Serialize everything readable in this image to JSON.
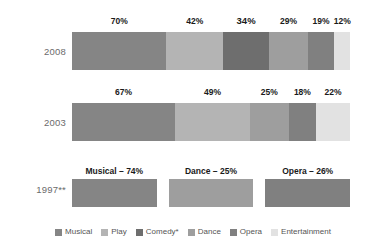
{
  "chart_data": {
    "type": "bar",
    "orientation": "horizontal",
    "title": "",
    "subtitle": "",
    "xlabel": "",
    "ylabel": "",
    "grid": false,
    "legend_position": "bottom",
    "categories": [
      "2008",
      "2003",
      "1997**"
    ],
    "legend": [
      {
        "name": "Musical",
        "color": "#858585"
      },
      {
        "name": "Play",
        "color": "#b4b4b4"
      },
      {
        "name": "Comedy*",
        "color": "#6e6e6e"
      },
      {
        "name": "Dance",
        "color": "#9e9e9e"
      },
      {
        "name": "Opera",
        "color": "#808080"
      },
      {
        "name": "Entertainment",
        "color": "#e2e2e2"
      }
    ],
    "rows": [
      {
        "year": "2008",
        "segments": [
          {
            "series": "Musical",
            "value": 70,
            "label": "70%",
            "color": "#858585",
            "emphasis": false
          },
          {
            "series": "Play",
            "value": 42,
            "label": "42%",
            "color": "#b4b4b4",
            "emphasis": false
          },
          {
            "series": "Comedy*",
            "value": 34,
            "label": "34%",
            "color": "#6e6e6e",
            "emphasis": true
          },
          {
            "series": "Dance",
            "value": 29,
            "label": "29%",
            "color": "#9e9e9e",
            "emphasis": false
          },
          {
            "series": "Opera",
            "value": 19,
            "label": "19%",
            "color": "#808080",
            "emphasis": false
          },
          {
            "series": "Entertainment",
            "value": 12,
            "label": "12%",
            "color": "#e2e2e2",
            "emphasis": false
          }
        ]
      },
      {
        "year": "2003",
        "segments": [
          {
            "series": "Musical",
            "value": 67,
            "label": "67%",
            "color": "#858585",
            "emphasis": false
          },
          {
            "series": "Play",
            "value": 49,
            "label": "49%",
            "color": "#b4b4b4",
            "emphasis": false
          },
          {
            "series": "Dance",
            "value": 25,
            "label": "25%",
            "color": "#9e9e9e",
            "emphasis": false
          },
          {
            "series": "Opera",
            "value": 18,
            "label": "18%",
            "color": "#808080",
            "emphasis": false
          },
          {
            "series": "Entertainment",
            "value": 22,
            "label": "22%",
            "color": "#e2e2e2",
            "emphasis": false
          }
        ]
      },
      {
        "year": "1997**",
        "segments": [
          {
            "series": "Musical",
            "value": 74,
            "label": "Musical – 74%",
            "color": "#858585",
            "emphasis": false
          },
          {
            "series": "Dance",
            "value": 25,
            "label": "Dance – 25%",
            "color": "#9e9e9e",
            "emphasis": false
          },
          {
            "series": "Opera",
            "value": 26,
            "label": "Opera – 26%",
            "color": "#808080",
            "emphasis": false
          }
        ]
      }
    ]
  }
}
